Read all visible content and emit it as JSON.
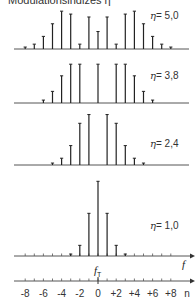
{
  "title": "Modulationsindizes η",
  "center_x": 98,
  "spacing": 9.1,
  "scale": 97,
  "panels": [
    {
      "eta_symbol": "η",
      "eta_value": "= 5,0",
      "baseline": 49,
      "label_x": 158,
      "label_y": 15
    },
    {
      "eta_symbol": "η",
      "eta_value": "= 3,8",
      "baseline": 103,
      "label_x": 158,
      "label_y": 77
    },
    {
      "eta_symbol": "η",
      "eta_value": "= 2,4",
      "baseline": 165,
      "label_x": 158,
      "label_y": 139
    },
    {
      "eta_symbol": "η",
      "eta_value": "= 1,0",
      "baseline": 256,
      "label_x": 158,
      "label_y": 230
    }
  ],
  "axis": {
    "f_label": "f",
    "fT_label": "f",
    "fT_sub": "T",
    "n_label": "n",
    "tick_labels": [
      "-8",
      "-6",
      "-4",
      "-2",
      "0",
      "+2",
      "+4",
      "+6",
      "+8"
    ],
    "tick_values": [
      -8,
      -6,
      -4,
      -2,
      0,
      2,
      4,
      6,
      8
    ]
  },
  "chart_data": {
    "type": "bar",
    "title": "Modulationsindizes η",
    "xlabel": "n",
    "ylabel": "",
    "categories": [
      -8,
      -7,
      -6,
      -5,
      -4,
      -3,
      -2,
      -1,
      0,
      1,
      2,
      3,
      4,
      5,
      6,
      7,
      8
    ],
    "series": [
      {
        "name": "η = 5,0",
        "values": [
          0.02,
          0.05,
          0.13,
          0.26,
          0.39,
          0.36,
          0.05,
          0.33,
          0.18,
          0.33,
          0.05,
          0.36,
          0.39,
          0.26,
          0.13,
          0.05,
          0.02
        ]
      },
      {
        "name": "η = 3,8",
        "values": [
          0.0,
          0.01,
          0.03,
          0.12,
          0.28,
          0.4,
          0.4,
          0.01,
          0.4,
          0.01,
          0.4,
          0.4,
          0.28,
          0.12,
          0.03,
          0.01,
          0.0
        ]
      },
      {
        "name": "η = 2,4",
        "values": [
          0.0,
          0.0,
          0.0,
          0.02,
          0.07,
          0.2,
          0.43,
          0.52,
          0.0,
          0.52,
          0.43,
          0.2,
          0.07,
          0.02,
          0.0,
          0.0,
          0.0
        ]
      },
      {
        "name": "η = 1,0",
        "values": [
          0.0,
          0.0,
          0.0,
          0.0,
          0.0,
          0.02,
          0.11,
          0.44,
          0.77,
          0.44,
          0.11,
          0.02,
          0.0,
          0.0,
          0.0,
          0.0,
          0.0
        ]
      }
    ]
  }
}
